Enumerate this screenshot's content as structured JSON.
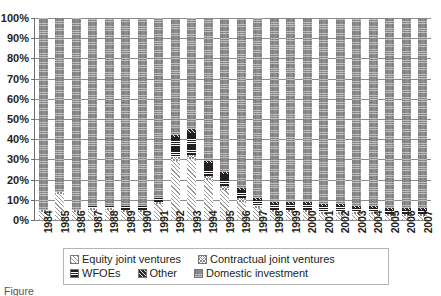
{
  "chart_data": {
    "type": "bar",
    "stacked": true,
    "stack_mode": "percent",
    "title": "",
    "xlabel": "",
    "ylabel": "",
    "ylim": [
      0,
      100
    ],
    "yticks": [
      0,
      10,
      20,
      30,
      40,
      50,
      60,
      70,
      80,
      90,
      100
    ],
    "ytick_labels": [
      "0%",
      "10%",
      "20%",
      "30%",
      "40%",
      "50%",
      "60%",
      "70%",
      "80%",
      "90%",
      "100%"
    ],
    "grid": true,
    "legend_position": "bottom",
    "categories": [
      "1984",
      "1985",
      "1986",
      "1987",
      "1988",
      "1989",
      "1990",
      "1991",
      "1992",
      "1993",
      "1994",
      "1995",
      "1996",
      "1997",
      "1998",
      "1999",
      "2000",
      "2001",
      "2002",
      "2003",
      "2004",
      "2005",
      "2006",
      "2007"
    ],
    "series": [
      {
        "name": "Equity joint ventures",
        "pattern": "diagonal-hatch-light",
        "values": [
          4,
          13,
          4,
          5,
          5,
          4,
          4,
          8,
          29,
          30,
          20,
          15,
          9,
          6,
          4,
          4,
          4,
          3,
          3,
          3,
          3,
          2,
          2,
          2
        ]
      },
      {
        "name": "Contractual joint ventures",
        "pattern": "cross-hatch-light",
        "values": [
          1,
          1,
          1,
          1,
          1,
          1,
          1,
          1,
          2,
          2,
          2,
          2,
          2,
          1,
          1,
          1,
          1,
          1,
          1,
          1,
          1,
          1,
          1,
          1
        ]
      },
      {
        "name": "WFOEs",
        "pattern": "solid-dark",
        "values": [
          0,
          0,
          0,
          1,
          1,
          2,
          2,
          2,
          10,
          11,
          6,
          6,
          4,
          3,
          3,
          3,
          3,
          3,
          3,
          2,
          2,
          2,
          2,
          2
        ]
      },
      {
        "name": "Other",
        "pattern": "diagonal-hatch-dark",
        "values": [
          0,
          0,
          0,
          0,
          0,
          0,
          0,
          0,
          1,
          2,
          1,
          1,
          1,
          1,
          1,
          1,
          1,
          1,
          1,
          1,
          1,
          1,
          1,
          1
        ]
      },
      {
        "name": "Domestic investment",
        "pattern": "checker-grey",
        "values": [
          95,
          86,
          95,
          93,
          93,
          93,
          93,
          89,
          58,
          55,
          71,
          76,
          84,
          89,
          91,
          91,
          91,
          92,
          92,
          93,
          93,
          94,
          94,
          94
        ]
      }
    ],
    "legend": [
      {
        "label": "Equity joint ventures",
        "swatch": "diagonal-hatch-light"
      },
      {
        "label": "Contractual joint ventures",
        "swatch": "cross-hatch-light"
      },
      {
        "label": "WFOEs",
        "swatch": "solid-dark"
      },
      {
        "label": "Other",
        "swatch": "diagonal-hatch-dark"
      },
      {
        "label": "Domestic investment",
        "swatch": "checker-grey"
      }
    ],
    "colors": {
      "equity_joint_ventures": "#9a9a9a",
      "contractual_joint_ventures": "#8a8a8a",
      "wfoes": "#231f20",
      "other": "#2e2a2b",
      "domestic_investment": "#8d8d8d",
      "gridline": "#8d8d8d",
      "text": "#231f20",
      "background": "#ffffff"
    }
  },
  "caption": {
    "text": "Figure"
  }
}
